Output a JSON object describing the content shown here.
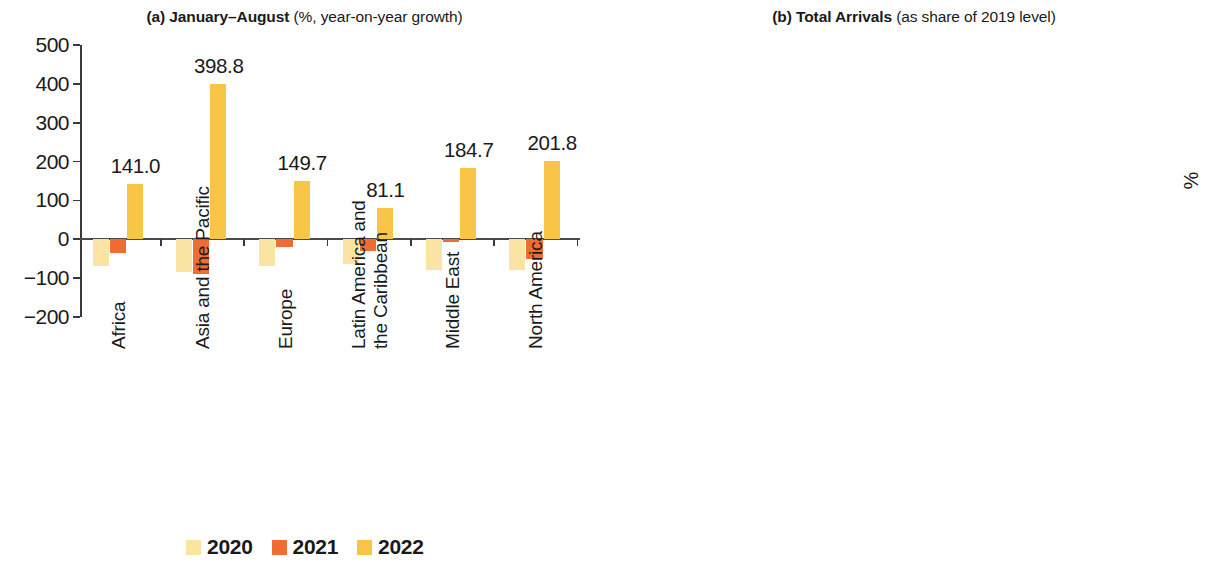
{
  "panels": [
    {
      "id": "a",
      "title_prefix": "(a) January–August ",
      "title_suffix": "(%, year-on-year growth)",
      "axis_unit": ""
    },
    {
      "id": "b",
      "title_prefix": "(b) Total Arrivals ",
      "title_suffix": "(as share of 2019 level)",
      "axis_unit": "%"
    }
  ],
  "legend": {
    "a": [
      {
        "label": "2020",
        "color": "#FBE3A4"
      },
      {
        "label": "2021",
        "color": "#EF6C35"
      },
      {
        "label": "2022",
        "color": "#F8C546"
      }
    ],
    "b": [
      {
        "label": "2020",
        "color": "#CFEA93"
      },
      {
        "label": "2021",
        "color": "#AEE05A"
      },
      {
        "label": "2022",
        "color": "#86D12E"
      }
    ]
  },
  "colors": {
    "a_2020": "#FBE3A4",
    "a_2021": "#EF6C35",
    "a_2022": "#F8C546",
    "b_2020": "#CFEA93",
    "b_2021": "#AEE05A",
    "b_2022": "#86D12E",
    "axis": "#3a3a3a",
    "text": "#1a1a1a"
  },
  "chart_data": [
    {
      "type": "bar",
      "panel": "a",
      "title": "(a) January–August (%, year-on-year growth)",
      "xlabel": "",
      "ylabel": "",
      "ylim": [
        -200,
        500
      ],
      "yticks": [
        -200,
        -100,
        0,
        100,
        200,
        300,
        400,
        500
      ],
      "ytick_labels": [
        "−200",
        "−100",
        "0",
        "100",
        "200",
        "300",
        "400",
        "500"
      ],
      "grid": false,
      "legend_position": "bottom",
      "categories": [
        "Africa",
        "Asia and the Pacific",
        "Europe",
        "Latin America and the Caribbean",
        "Middle East",
        "North America"
      ],
      "category_lines": [
        [
          "Africa"
        ],
        [
          "Asia and the Pacific"
        ],
        [
          "Europe"
        ],
        [
          "Latin America and",
          "the Caribbean"
        ],
        [
          "Middle East"
        ],
        [
          "North America"
        ]
      ],
      "series": [
        {
          "name": "2020",
          "color": "#FBE3A4",
          "values": [
            -68.0,
            -84.0,
            -69.0,
            -64.0,
            -78.0,
            -78.0
          ]
        },
        {
          "name": "2021",
          "color": "#EF6C35",
          "values": [
            -35.0,
            -90.0,
            -20.0,
            -30.0,
            -8.0,
            -52.0
          ]
        },
        {
          "name": "2022",
          "color": "#F8C546",
          "values": [
            141.0,
            398.8,
            149.7,
            81.1,
            184.7,
            201.8
          ]
        }
      ],
      "data_labels": [
        "141.0",
        "398.8",
        "149.7",
        "81.1",
        "184.7",
        "201.8"
      ],
      "data_label_series": "2022"
    },
    {
      "type": "bar",
      "panel": "b",
      "title": "(b) Total Arrivals (as share of 2019 level)",
      "xlabel": "",
      "ylabel": "%",
      "ylim": [
        0,
        60
      ],
      "yticks": [
        0,
        10,
        20,
        30,
        40,
        50,
        60
      ],
      "ytick_labels": [
        "0",
        "10",
        "20",
        "30",
        "40",
        "50",
        "60"
      ],
      "grid": false,
      "legend_position": "bottom",
      "categories": [
        "Africa",
        "Asia and the Pacific",
        "Europe",
        "Latin America and the Caribbean",
        "Middle East",
        "North America"
      ],
      "category_lines": [
        [
          "Africa"
        ],
        [
          "Asia and the Pacific"
        ],
        [
          "Europe"
        ],
        [
          "Latin America and",
          "the Caribbean"
        ],
        [
          "Middle East"
        ],
        [
          "North America"
        ]
      ],
      "series": [
        {
          "name": "2020",
          "color": "#CFEA93",
          "values": [
            27.4,
            15.5,
            27.8,
            36.5,
            24.6,
            20.5
          ]
        },
        {
          "name": "2021",
          "color": "#AEE05A",
          "values": [
            34.4,
            4.0,
            36.2,
            42.6,
            36.9,
            22.4
          ]
        },
        {
          "name": "2022",
          "color": "#86D12E",
          "values": [
            39.4,
            9.8,
            50.9,
            43.7,
            51.4,
            33.3
          ]
        }
      ],
      "data_labels": [
        "39.4%",
        "10.3%",
        "50.9%",
        "43.7%",
        "51.4%",
        "33.3%"
      ],
      "data_label_series": "2022"
    }
  ]
}
